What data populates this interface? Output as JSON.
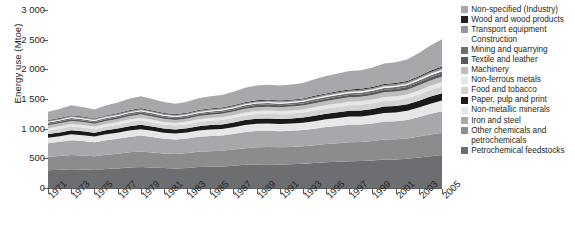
{
  "axes": {
    "ylabel": "Energy use (Mtoe)",
    "yticks": [
      "3 000",
      "2 500",
      "2 000",
      "1 500",
      "1 000",
      "500",
      "0"
    ],
    "ylim": [
      0,
      3000
    ],
    "xticks": [
      "1971",
      "1973",
      "1975",
      "1977",
      "1979",
      "1981",
      "1983",
      "1985",
      "1987",
      "1989",
      "1991",
      "1993",
      "1995",
      "1997",
      "1999",
      "2001",
      "2003",
      "2005"
    ],
    "grid": false
  },
  "legend": {
    "position": "right",
    "items": [
      {
        "label": "Non-specified (Industry)",
        "color": "#a6a8ab",
        "wrap": false
      },
      {
        "label": "Wood and wood products",
        "color": "#231f20",
        "wrap": false
      },
      {
        "label": "Transport equipment",
        "color": "#939598",
        "wrap": false
      },
      {
        "label": "Construction",
        "color": "#f1f2f2",
        "wrap": false
      },
      {
        "label": "Mining and quarrying",
        "color": "#6d6e71",
        "wrap": false
      },
      {
        "label": "Textile and leather",
        "color": "#58595b",
        "wrap": false
      },
      {
        "label": "Machinery",
        "color": "#bcbec0",
        "wrap": false
      },
      {
        "label": "Non-ferrous metals",
        "color": "#e6e7e8",
        "wrap": false
      },
      {
        "label": "Food and tobacco",
        "color": "#d1d3d4",
        "wrap": false
      },
      {
        "label": "Paper, pulp and print",
        "color": "#1a1a1a",
        "wrap": false
      },
      {
        "label": "Non-metallic minerals",
        "color": "#e6e7e8",
        "wrap": false
      },
      {
        "label": "Iron and steel",
        "color": "#a6a8ab",
        "wrap": false
      },
      {
        "label": "Other chemicals and petrochemicals",
        "color": "#8a8c8e",
        "wrap": true
      },
      {
        "label": "Petrochemical feedstocks",
        "color": "#6d6e71",
        "wrap": false
      }
    ]
  },
  "chart_data": {
    "type": "area",
    "title": "",
    "xlabel": "",
    "ylabel": "Energy use (Mtoe)",
    "ylim": [
      0,
      3000
    ],
    "stacked": true,
    "x": [
      1971,
      1972,
      1973,
      1974,
      1975,
      1976,
      1977,
      1978,
      1979,
      1980,
      1981,
      1982,
      1983,
      1984,
      1985,
      1986,
      1987,
      1988,
      1989,
      1990,
      1991,
      1992,
      1993,
      1994,
      1995,
      1996,
      1997,
      1998,
      1999,
      2000,
      2001,
      2002,
      2003,
      2004,
      2005
    ],
    "series": [
      {
        "name": "Petrochemical feedstocks",
        "color": "#6d6e71",
        "values": [
          300,
          308,
          318,
          312,
          305,
          320,
          330,
          345,
          355,
          345,
          335,
          330,
          338,
          352,
          358,
          362,
          375,
          390,
          398,
          400,
          398,
          402,
          408,
          420,
          432,
          442,
          452,
          455,
          465,
          480,
          482,
          492,
          512,
          535,
          555
        ]
      },
      {
        "name": "Other chemicals and petrochemicals",
        "color": "#8a8c8e",
        "values": [
          225,
          232,
          240,
          236,
          230,
          240,
          248,
          256,
          262,
          255,
          248,
          245,
          250,
          258,
          262,
          265,
          272,
          282,
          288,
          290,
          288,
          290,
          294,
          300,
          308,
          314,
          320,
          322,
          328,
          336,
          338,
          344,
          356,
          368,
          378
        ]
      },
      {
        "name": "Iron and steel",
        "color": "#a6a8ab",
        "values": [
          230,
          238,
          248,
          244,
          236,
          246,
          252,
          260,
          266,
          258,
          248,
          242,
          246,
          252,
          256,
          258,
          264,
          272,
          276,
          276,
          272,
          272,
          274,
          280,
          286,
          290,
          294,
          292,
          296,
          304,
          306,
          312,
          328,
          348,
          362
        ]
      },
      {
        "name": "Non-metallic minerals",
        "color": "#e6e7e8",
        "values": [
          92,
          95,
          99,
          98,
          95,
          99,
          102,
          106,
          109,
          106,
          102,
          100,
          102,
          106,
          108,
          110,
          113,
          118,
          120,
          121,
          120,
          121,
          123,
          127,
          131,
          134,
          137,
          138,
          141,
          146,
          148,
          152,
          160,
          170,
          178
        ]
      },
      {
        "name": "Paper, pulp and print",
        "color": "#1a1a1a",
        "values": [
          62,
          64,
          67,
          66,
          64,
          67,
          69,
          72,
          74,
          72,
          70,
          69,
          71,
          74,
          76,
          77,
          80,
          83,
          85,
          86,
          86,
          87,
          89,
          92,
          95,
          97,
          100,
          101,
          103,
          107,
          108,
          110,
          115,
          120,
          124
        ]
      },
      {
        "name": "Food and tobacco",
        "color": "#d1d3d4",
        "values": [
          60,
          62,
          64,
          63,
          62,
          64,
          66,
          69,
          71,
          69,
          67,
          66,
          68,
          70,
          72,
          73,
          75,
          78,
          80,
          81,
          81,
          82,
          83,
          86,
          88,
          90,
          92,
          93,
          95,
          98,
          99,
          101,
          105,
          110,
          114
        ]
      },
      {
        "name": "Non-ferrous metals",
        "color": "#e6e7e8",
        "values": [
          40,
          41,
          43,
          42,
          41,
          43,
          44,
          46,
          47,
          46,
          44,
          43,
          44,
          46,
          47,
          48,
          49,
          51,
          52,
          53,
          53,
          53,
          54,
          56,
          58,
          59,
          60,
          61,
          62,
          64,
          65,
          66,
          69,
          72,
          75
        ]
      },
      {
        "name": "Machinery",
        "color": "#bcbec0",
        "values": [
          48,
          50,
          52,
          51,
          50,
          52,
          53,
          55,
          57,
          55,
          53,
          52,
          53,
          55,
          57,
          58,
          60,
          62,
          64,
          64,
          64,
          65,
          66,
          68,
          70,
          72,
          73,
          74,
          76,
          78,
          79,
          81,
          85,
          89,
          92
        ]
      },
      {
        "name": "Textile and leather",
        "color": "#58595b",
        "values": [
          26,
          27,
          28,
          27,
          27,
          28,
          29,
          30,
          31,
          30,
          29,
          28,
          29,
          30,
          31,
          31,
          32,
          33,
          34,
          35,
          34,
          35,
          35,
          37,
          38,
          39,
          40,
          40,
          41,
          42,
          43,
          44,
          46,
          49,
          51
        ]
      },
      {
        "name": "Mining and quarrying",
        "color": "#6d6e71",
        "values": [
          20,
          21,
          21,
          21,
          20,
          21,
          22,
          23,
          23,
          23,
          22,
          22,
          22,
          23,
          24,
          24,
          25,
          26,
          26,
          27,
          26,
          27,
          27,
          28,
          29,
          30,
          30,
          31,
          31,
          32,
          33,
          33,
          35,
          37,
          39
        ]
      },
      {
        "name": "Construction",
        "color": "#f1f2f2",
        "values": [
          14,
          14,
          15,
          15,
          14,
          15,
          15,
          16,
          16,
          16,
          15,
          15,
          16,
          16,
          17,
          17,
          17,
          18,
          18,
          19,
          18,
          19,
          19,
          20,
          20,
          21,
          21,
          22,
          22,
          23,
          23,
          24,
          25,
          26,
          27
        ]
      },
      {
        "name": "Transport equipment",
        "color": "#939598",
        "values": [
          16,
          17,
          17,
          17,
          17,
          17,
          18,
          19,
          19,
          19,
          18,
          18,
          18,
          19,
          20,
          20,
          21,
          21,
          22,
          22,
          22,
          22,
          23,
          24,
          24,
          25,
          26,
          26,
          27,
          27,
          28,
          28,
          30,
          31,
          33
        ]
      },
      {
        "name": "Wood and wood products",
        "color": "#231f20",
        "values": [
          10,
          10,
          11,
          11,
          10,
          11,
          11,
          12,
          12,
          12,
          11,
          11,
          11,
          12,
          12,
          12,
          13,
          13,
          14,
          14,
          14,
          14,
          14,
          15,
          15,
          16,
          16,
          16,
          17,
          17,
          18,
          18,
          19,
          20,
          21
        ]
      },
      {
        "name": "Non-specified (Industry)",
        "color": "#a6a8ab",
        "values": [
          143,
          152,
          170,
          162,
          152,
          168,
          180,
          196,
          206,
          196,
          186,
          180,
          186,
          200,
          208,
          214,
          226,
          244,
          252,
          254,
          250,
          254,
          262,
          278,
          292,
          302,
          312,
          314,
          326,
          344,
          348,
          360,
          390,
          428,
          460
        ]
      }
    ]
  }
}
